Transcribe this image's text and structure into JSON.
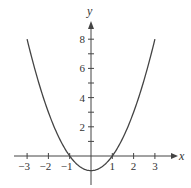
{
  "chart_data": {
    "type": "line",
    "title": "",
    "xlabel": "x",
    "ylabel": "y",
    "function": "y = x^2 - 1",
    "xlim": [
      -3.3,
      3.5
    ],
    "ylim": [
      -1.9,
      9.5
    ],
    "x_ticks": [
      -3,
      -2,
      -1,
      1,
      2,
      3
    ],
    "x_tick_labels": [
      "−3",
      "−2",
      "−1",
      "1",
      "2",
      "3"
    ],
    "y_ticks": [
      1,
      2,
      3,
      4,
      5,
      6,
      7,
      8
    ],
    "y_tick_labels": [
      "2",
      "4",
      "6",
      "8"
    ],
    "y_labeled_ticks": [
      2,
      4,
      6,
      8
    ],
    "grid": false,
    "legend": null,
    "series": [
      {
        "name": "y = x^2 - 1",
        "x": [
          -3,
          -2.5,
          -2,
          -1.5,
          -1,
          -0.5,
          0,
          0.5,
          1,
          1.5,
          2,
          2.5,
          3
        ],
        "values": [
          8,
          5.25,
          3,
          1.25,
          0,
          -0.75,
          -1,
          -0.75,
          0,
          1.25,
          3,
          5.25,
          8
        ]
      }
    ],
    "colors": {
      "curve": "#444444",
      "axes": "#444444"
    }
  }
}
